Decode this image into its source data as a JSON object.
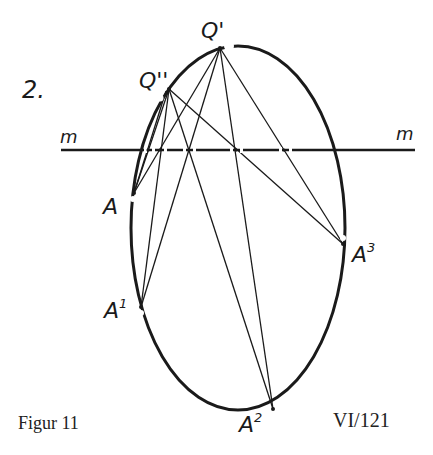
{
  "figure": {
    "number_label": "2.",
    "caption": "Figur 11",
    "reference": "VI/121",
    "line_label_left": "m",
    "line_label_right": "m"
  },
  "points": {
    "Q1": {
      "label": "Q'",
      "x": 220,
      "y": 48
    },
    "Q2": {
      "label": "Q''",
      "x": 169,
      "y": 89
    },
    "A": {
      "label": "A",
      "x": 134,
      "y": 193
    },
    "A1": {
      "label": "A",
      "sup": "1",
      "x": 141,
      "y": 307
    },
    "A2": {
      "label": "A",
      "sup": "2",
      "x": 273,
      "y": 409
    },
    "A3": {
      "label": "A",
      "sup": "3",
      "x": 343,
      "y": 244
    }
  },
  "ellipse": {
    "cx": 238,
    "cy": 228,
    "rx": 107,
    "ry": 182
  },
  "line_m": {
    "x1": 61,
    "x2": 415,
    "y": 150
  },
  "intersections_on_m": [
    148,
    160,
    189,
    236,
    284
  ],
  "colors": {
    "ink": "#1a1a1a",
    "background": "#ffffff"
  }
}
